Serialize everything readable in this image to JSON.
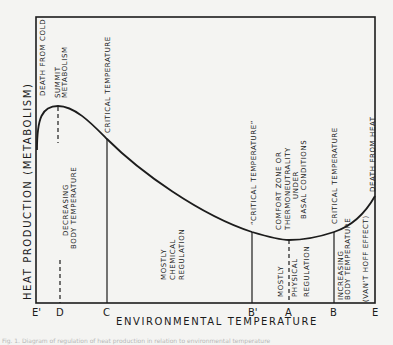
{
  "diagram": {
    "y_axis_label": "HEAT PRODUCTION   (METABOLISM)",
    "x_axis_label": "ENVIRONMENTAL  TEMPERATURE",
    "x_ticks": [
      {
        "label": "E'",
        "x": 36
      },
      {
        "label": "D",
        "x": 60
      },
      {
        "label": "C",
        "x": 107
      },
      {
        "label": "B'",
        "x": 252
      },
      {
        "label": "A",
        "x": 289
      },
      {
        "label": "B",
        "x": 334
      },
      {
        "label": "E",
        "x": 375
      }
    ],
    "labels": {
      "death_from_cold": "DEATH FROM COLD",
      "summit_1": "SUMMIT",
      "summit_2": "METABOLISM",
      "critical_c": "CRITICAL  TEMPERATURE",
      "decreasing_1": "DECREASING",
      "decreasing_2": "BODY TEMPERATURE",
      "chem_1": "MOSTLY",
      "chem_2": "CHEMICAL",
      "chem_3": "REGULATION",
      "critical_bprime": "“CRITICAL  TEMPERATURE”",
      "comfort_1": "COMFORT  ZONE  OR",
      "comfort_2": "THERMONEUTRALITY",
      "comfort_3": "UNDER",
      "comfort_4": "BASAL  CONDITIONS",
      "phys_1": "MOSTLY",
      "phys_2": "PHYSICAL",
      "phys_3": "REGULATION",
      "critical_b": "CRITICAL  TEMPERATURE",
      "increasing_1": "INCREASING",
      "increasing_2": "BODY TEMPERATURE",
      "vanthoff": "(VAN'T HOFF EFFECT)",
      "death_from_heat": "DEATH FROM HEAT"
    },
    "caption": "Fig. 1. Diagram of regulation of heat production in relation to environmental temperature"
  }
}
